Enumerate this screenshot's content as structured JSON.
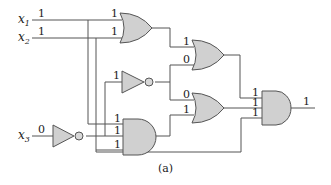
{
  "diagram": {
    "caption": "(a)",
    "inputs": [
      {
        "name": "x",
        "sub": "1",
        "value": "1"
      },
      {
        "name": "x",
        "sub": "2",
        "value": "1"
      },
      {
        "name": "x",
        "sub": "3",
        "value": "0"
      }
    ],
    "gates": {
      "or1": {
        "type": "OR",
        "in_a": "1",
        "in_b": "1"
      },
      "not_mid": {
        "type": "NOT",
        "in": "1"
      },
      "or2": {
        "type": "OR",
        "in_a": "1",
        "in_b": "0"
      },
      "or3": {
        "type": "OR",
        "in_a": "0",
        "in_b": "1"
      },
      "not_x3": {
        "type": "NOT"
      },
      "and1": {
        "type": "AND",
        "in_a": "1",
        "in_b": "1",
        "in_c": "1"
      },
      "and_final": {
        "type": "AND",
        "in_a": "1",
        "in_b": "1",
        "in_c": "1",
        "out": "1"
      }
    }
  }
}
